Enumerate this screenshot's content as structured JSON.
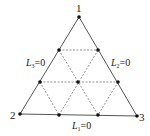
{
  "diagram": {
    "vertices": [
      {
        "id": "1",
        "label": "1",
        "x": 79,
        "y": 17
      },
      {
        "id": "2",
        "label": "2",
        "x": 20,
        "y": 114
      },
      {
        "id": "3",
        "label": "3",
        "x": 137,
        "y": 116
      }
    ],
    "nodes": [
      {
        "x": 79,
        "y": 17
      },
      {
        "x": 59,
        "y": 50
      },
      {
        "x": 98,
        "y": 50
      },
      {
        "x": 40,
        "y": 82
      },
      {
        "x": 78,
        "y": 82
      },
      {
        "x": 118,
        "y": 82
      },
      {
        "x": 20,
        "y": 114
      },
      {
        "x": 59,
        "y": 115
      },
      {
        "x": 98,
        "y": 115
      },
      {
        "x": 137,
        "y": 116
      }
    ],
    "edge_labels": {
      "left": {
        "var": "L",
        "sub": "3",
        "eq": "=0"
      },
      "right": {
        "var": "L",
        "sub": "2",
        "eq": "=0"
      },
      "bottom": {
        "var": "L",
        "sub": "1",
        "eq": "=0"
      }
    },
    "colors": {
      "edge": "#555555",
      "dashed": "#777777",
      "node": "#111111"
    }
  }
}
